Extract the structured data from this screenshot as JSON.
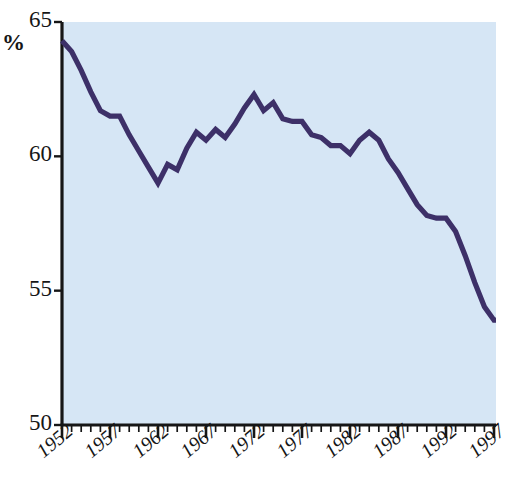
{
  "chart_data": {
    "type": "line",
    "title": "",
    "subtitle": "",
    "xlabel": "",
    "ylabel": "%",
    "ylabel_text": "%",
    "xlim": [
      1952,
      1998
    ],
    "ylim": [
      50,
      65
    ],
    "grid": false,
    "legend": "none",
    "y_ticks": [
      50,
      55,
      60,
      65
    ],
    "y_tick_labels": [
      "50",
      "55",
      "60",
      "65"
    ],
    "x_ticks": [
      1952,
      1957,
      1962,
      1967,
      1972,
      1977,
      1982,
      1987,
      1992,
      1997
    ],
    "x_tick_labels": [
      "1952",
      "1957",
      "1962",
      "1967",
      "1972",
      "1977",
      "1982",
      "1987",
      "1992",
      "1997"
    ],
    "x_minor_tick_interval": 1,
    "line_color": "#3d3068",
    "plot_background": "#d6e6f5",
    "axis_color": "#161616",
    "x": [
      1952,
      1953,
      1954,
      1955,
      1956,
      1957,
      1958,
      1959,
      1960,
      1961,
      1962,
      1963,
      1964,
      1965,
      1966,
      1967,
      1968,
      1969,
      1970,
      1971,
      1972,
      1973,
      1974,
      1975,
      1976,
      1977,
      1978,
      1979,
      1980,
      1981,
      1982,
      1983,
      1984,
      1985,
      1986,
      1987,
      1988,
      1989,
      1990,
      1991,
      1992,
      1993,
      1994,
      1995,
      1996,
      1997,
      1998
    ],
    "values": [
      64.3,
      63.9,
      63.2,
      62.4,
      61.7,
      61.5,
      61.5,
      60.8,
      60.2,
      59.6,
      59.0,
      59.7,
      59.5,
      60.3,
      60.9,
      60.6,
      61.0,
      60.7,
      61.2,
      61.8,
      62.3,
      61.7,
      62.0,
      61.4,
      61.3,
      61.3,
      60.8,
      60.7,
      60.4,
      60.4,
      60.1,
      60.6,
      60.9,
      60.6,
      59.9,
      59.4,
      58.8,
      58.2,
      57.8,
      57.7,
      57.7,
      57.2,
      56.3,
      55.3,
      54.4,
      53.9,
      53.9
    ],
    "series": [
      {
        "name": "series-1",
        "values": [
          64.3,
          63.9,
          63.2,
          62.4,
          61.7,
          61.5,
          61.5,
          60.8,
          60.2,
          59.6,
          59.0,
          59.7,
          59.5,
          60.3,
          60.9,
          60.6,
          61.0,
          60.7,
          61.2,
          61.8,
          62.3,
          61.7,
          62.0,
          61.4,
          61.3,
          61.3,
          60.8,
          60.7,
          60.4,
          60.4,
          60.1,
          60.6,
          60.9,
          60.6,
          59.9,
          59.4,
          58.8,
          58.2,
          57.8,
          57.7,
          57.7,
          57.2,
          56.3,
          55.3,
          54.4,
          53.9,
          53.9
        ]
      }
    ]
  }
}
